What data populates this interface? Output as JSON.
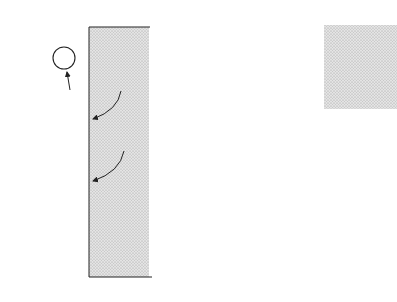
{
  "figure": {
    "panel_a": {
      "label": "(a)",
      "surface_label": "Cathode surface",
      "molecule": "H₂",
      "electron_label": "e",
      "ion_label": "H⁺",
      "ions": [
        {
          "x": 48,
          "y": 110
        },
        {
          "x": 78,
          "y": 122
        },
        {
          "x": 20,
          "y": 131
        },
        {
          "x": 52,
          "y": 145
        },
        {
          "x": 20,
          "y": 159
        },
        {
          "x": 51,
          "y": 171
        },
        {
          "x": 78,
          "y": 184
        },
        {
          "x": 40,
          "y": 194
        },
        {
          "x": 60,
          "y": 211
        },
        {
          "x": 38,
          "y": 233
        }
      ],
      "electrons": [
        {
          "x": 122,
          "y": 83
        },
        {
          "x": 122,
          "y": 143
        }
      ]
    },
    "panel_b": {
      "label": "(b)",
      "surface_label": "Cathode surface",
      "zone_label": "Depletion zone",
      "ion_label": "H⁺",
      "ions": [
        {
          "x": 251,
          "y": 80
        },
        {
          "x": 242,
          "y": 109
        },
        {
          "x": 282,
          "y": 101
        },
        {
          "x": 264,
          "y": 129
        },
        {
          "x": 245,
          "y": 150
        },
        {
          "x": 281,
          "y": 162
        },
        {
          "x": 263,
          "y": 183
        },
        {
          "x": 281,
          "y": 202
        },
        {
          "x": 241,
          "y": 218
        }
      ]
    }
  }
}
